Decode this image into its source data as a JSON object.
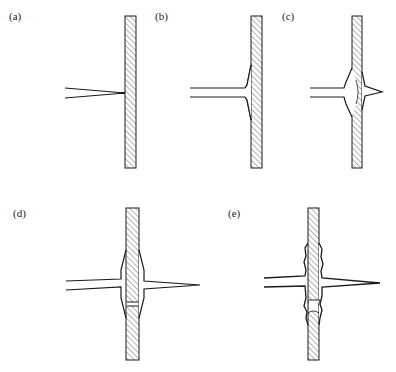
{
  "figure": {
    "panels": [
      {
        "id": "a",
        "label": "(a)",
        "description": "Tapered tip approaching hatched wall, touching surface"
      },
      {
        "id": "b",
        "label": "(b)",
        "description": "Tip contacts wall; wall surface bulges slightly around contact"
      },
      {
        "id": "c",
        "label": "(c)",
        "description": "Tip partially penetrates wall; lens-shaped deformation with protrusion on far side"
      },
      {
        "id": "d",
        "label": "(d)",
        "description": "Tip fully penetrates wall; plug of wall material displaced with gap below"
      },
      {
        "id": "e",
        "label": "(e)",
        "description": "Penetration complete; irregular, ragged edges around hole and displaced plug"
      }
    ],
    "colors": {
      "line": "#1a1a1a",
      "hatch": "#444444",
      "background": "#ffffff"
    }
  }
}
